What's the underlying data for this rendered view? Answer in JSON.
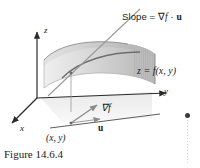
{
  "figure": {
    "caption": "Figure 14.6.4",
    "axes": {
      "z_label": "z",
      "y_label": "y",
      "x_label": "x"
    },
    "labels": {
      "slope_prefix": "Slope = ",
      "slope_nabla": "∇",
      "slope_f": "f",
      "slope_dot": " · ",
      "slope_u": "u",
      "slope_full": "Slope = ∇f · u",
      "surface_equation": "z = f(x, y)",
      "gradient": "∇f",
      "unit_vector": "u",
      "point": "(x, y)"
    },
    "colors": {
      "ink": "#1a1a1a",
      "axis": "#2b2b2b",
      "surface_light": "#e8e8e8",
      "surface_mid": "#cfcfcf",
      "surface_dark": "#a9a9a9",
      "surface_edge": "#6e6e6e",
      "shadow": "#f0f0f0",
      "vector": "#8a8a8a",
      "tangent_line": "#9a9a9a",
      "marker_dot": "#3b3b3b",
      "background": "#ffffff"
    }
  }
}
